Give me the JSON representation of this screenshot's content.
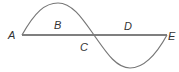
{
  "diagram": {
    "type": "sine-wave-over-line",
    "labels": {
      "A": "A",
      "B": "B",
      "C": "C",
      "D": "D",
      "E": "E"
    },
    "colors": {
      "line": "#555555",
      "curve": "#777777",
      "text": "#333333"
    }
  }
}
